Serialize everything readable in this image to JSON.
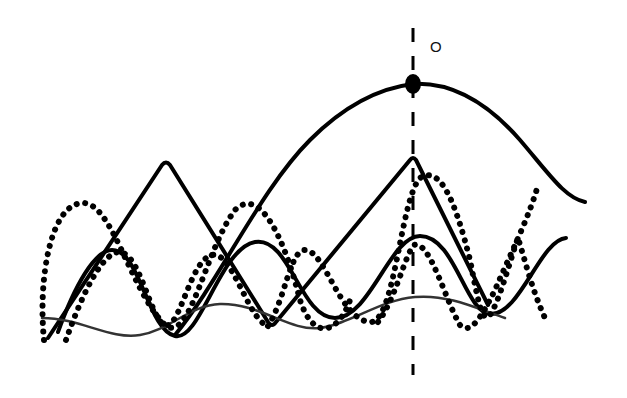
{
  "diagram": {
    "point_label": "O",
    "point": {
      "x": 413,
      "y": 84
    },
    "reference_line": {
      "x": 413,
      "y_start": 28,
      "y_end": 375,
      "style": "dashed"
    },
    "curves": [
      {
        "name": "large-arch",
        "style": "solid-thick",
        "color": "#000000",
        "path": "M 175 335 C 220 280, 260 190, 310 140 C 345 105, 380 88, 413 84 C 450 82, 485 100, 520 140 C 550 175, 565 198, 585 202"
      },
      {
        "name": "triangle-wave",
        "style": "solid-thick",
        "color": "#000000",
        "path": "M 48 338 L 162 165 Q 166 160 170 165 L 268 322 Q 272 328 276 322 L 410 160 Q 413 156 416 160 L 488 305"
      },
      {
        "name": "smooth-wave",
        "style": "solid-thick",
        "color": "#000000",
        "path": "M 58 332 C 75 285, 95 250, 112 250 C 140 250, 148 330, 175 336 C 200 342, 220 248, 255 242 C 290 236, 300 318, 335 318 C 370 318, 390 236, 420 236 C 455 236, 465 312, 490 314 C 520 316, 540 240, 566 238"
      },
      {
        "name": "thin-wave",
        "style": "solid-thin",
        "color": "#333333",
        "path": "M 42 318 C 80 318, 110 340, 140 335 C 170 330, 190 305, 220 304 C 260 303, 290 332, 320 328 C 350 324, 380 300, 415 297 C 450 294, 480 310, 505 318"
      },
      {
        "name": "dotted-wave-a",
        "style": "dotted",
        "color": "#000000",
        "path": "M 44 340 C 38 280, 50 205, 82 203 C 112 201, 130 290, 165 325 C 190 345, 205 250, 235 210 C 260 185, 285 240, 300 300 C 315 345, 340 330, 350 300"
      },
      {
        "name": "dotted-wave-b",
        "style": "dotted",
        "color": "#000000",
        "path": "M 66 340 C 80 300, 100 255, 118 252 C 140 250, 150 320, 165 325 C 180 330, 190 260, 212 255 C 232 250, 248 320, 268 326"
      },
      {
        "name": "dotted-wave-c",
        "style": "dotted",
        "color": "#000000",
        "path": "M 268 326 C 285 300, 290 250, 305 250 C 325 250, 340 320, 370 322 C 395 324, 400 200, 420 178 C 440 165, 455 200, 470 260 C 478 300, 482 325, 490 315 C 500 300, 510 260, 518 238 C 525 260, 532 290, 545 318"
      },
      {
        "name": "dotted-wave-d",
        "style": "dotted",
        "color": "#000000",
        "path": "M 378 322 C 395 300, 405 255, 414 245 C 430 240, 445 300, 460 325 C 470 335, 480 320, 495 290 C 510 255, 530 215, 538 185"
      }
    ]
  }
}
